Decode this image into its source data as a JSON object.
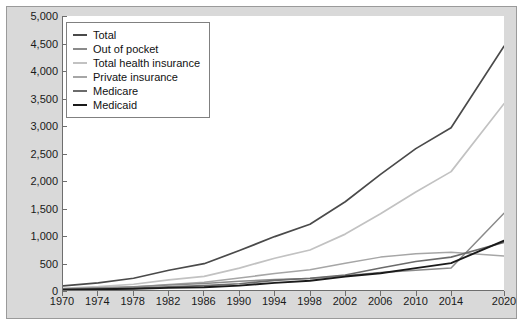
{
  "chart_data": {
    "type": "line",
    "title": "",
    "xlabel": "",
    "ylabel": "",
    "xlim": [
      1970,
      2020
    ],
    "ylim": [
      0,
      5000
    ],
    "grid": false,
    "legend_position": "top-left",
    "x_tick_labels": [
      "1970",
      "1974",
      "1978",
      "1982",
      "1986",
      "1990",
      "1994",
      "1998",
      "2002",
      "2006",
      "2010",
      "2014",
      "2020"
    ],
    "x_tick_values": [
      1970,
      1974,
      1978,
      1982,
      1986,
      1990,
      1994,
      1998,
      2002,
      2006,
      2010,
      2014,
      2020
    ],
    "y_tick_labels": [
      "0",
      "500",
      "1,000",
      "1,500",
      "2,000",
      "2,500",
      "3,000",
      "3,500",
      "4,000",
      "4,500",
      "5,000"
    ],
    "y_tick_values": [
      0,
      500,
      1000,
      1500,
      2000,
      2500,
      3000,
      3500,
      4000,
      4500,
      5000
    ],
    "x": [
      1970,
      1974,
      1978,
      1982,
      1986,
      1990,
      1994,
      1998,
      2002,
      2006,
      2010,
      2014,
      2020
    ],
    "series": [
      {
        "name": "Total",
        "color": "#4a4a4a",
        "width": 1.7,
        "values": [
          75,
          130,
          215,
          360,
          480,
          720,
          975,
          1200,
          1610,
          2110,
          2580,
          2960,
          4450
        ]
      },
      {
        "name": "Out of pocket",
        "color": "#8a8a8a",
        "width": 1.5,
        "values": [
          25,
          40,
          60,
          90,
          120,
          160,
          190,
          210,
          260,
          320,
          360,
          400,
          1400
        ]
      },
      {
        "name": "Total health insurance",
        "color": "#c2c2c2",
        "width": 1.7,
        "values": [
          32,
          60,
          105,
          185,
          250,
          400,
          580,
          730,
          1020,
          1390,
          1790,
          2160,
          3400
        ]
      },
      {
        "name": "Private insurance",
        "color": "#a6a6a6",
        "width": 1.5,
        "values": [
          18,
          32,
          55,
          100,
          140,
          220,
          300,
          370,
          490,
          600,
          660,
          690,
          620
        ]
      },
      {
        "name": "Medicare",
        "color": "#6b6b6b",
        "width": 1.6,
        "values": [
          8,
          17,
          30,
          58,
          80,
          115,
          175,
          215,
          275,
          400,
          520,
          600,
          870
        ]
      },
      {
        "name": "Medicaid",
        "color": "#1a1a1a",
        "width": 1.9,
        "values": [
          6,
          13,
          23,
          38,
          50,
          80,
          130,
          170,
          245,
          305,
          400,
          490,
          900
        ]
      }
    ]
  },
  "legend": {
    "items": [
      {
        "label": "Total"
      },
      {
        "label": "Out of pocket"
      },
      {
        "label": "Total health insurance"
      },
      {
        "label": "Private insurance"
      },
      {
        "label": "Medicare"
      },
      {
        "label": "Medicaid"
      }
    ]
  }
}
